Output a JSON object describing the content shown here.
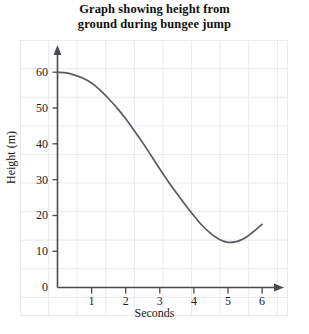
{
  "chart_data": {
    "type": "line",
    "title": "Graph showing height from ground during bungee jump",
    "title_lines": [
      "Graph showing height from",
      "ground during bungee jump"
    ],
    "xlabel": "Seconds",
    "ylabel": "Height (m)",
    "xlim": [
      0,
      6.3
    ],
    "ylim": [
      0,
      62
    ],
    "grid": true,
    "legend": "none",
    "x_ticks": [
      1,
      2,
      3,
      4,
      5,
      6
    ],
    "x_tick_labels": [
      "1",
      "2",
      "3",
      "4",
      "5",
      "6"
    ],
    "y_ticks": [
      0,
      10,
      20,
      30,
      40,
      50,
      60
    ],
    "y_tick_labels": [
      "0",
      "10",
      "20",
      "30",
      "40",
      "50",
      "60"
    ],
    "origin_label": "0",
    "series": [
      {
        "name": "height",
        "color": "#5a5a60",
        "x": [
          0,
          0.25,
          0.5,
          0.75,
          1,
          1.25,
          1.5,
          1.75,
          2,
          2.25,
          2.5,
          2.75,
          3,
          3.25,
          3.5,
          3.75,
          4,
          4.25,
          4.5,
          4.75,
          5,
          5.25,
          5.5,
          5.75,
          6
        ],
        "y": [
          60,
          59.8,
          59.2,
          58.3,
          57,
          55,
          52.6,
          50,
          47,
          43.7,
          40.3,
          36.7,
          33,
          29.5,
          26.2,
          23,
          20,
          17.2,
          15,
          13.4,
          12.6,
          12.8,
          13.8,
          15.6,
          17.6
        ]
      }
    ],
    "annotations": []
  },
  "axes": {
    "y_arrow": "up-arrow",
    "x_arrow": "right-arrow"
  }
}
